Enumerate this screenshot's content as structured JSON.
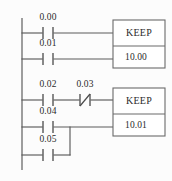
{
  "diagram": {
    "type": "ladder-logic",
    "width": 172,
    "height": 181,
    "background_color": "#fcfcfc",
    "line_color": "#5a5a5a",
    "text_color": "#2b2b2b"
  },
  "power_rail": {
    "name": "left-power-rail",
    "x": 22,
    "y_top": 18,
    "y_bottom": 170
  },
  "rungs": [
    {
      "index": 1,
      "y": 33,
      "contacts": [
        {
          "label": "0.00",
          "x": 48,
          "type": "normally-open"
        }
      ],
      "connects_to": "keep-block-1-set"
    },
    {
      "index": 2,
      "y": 59,
      "contacts": [
        {
          "label": "0.01",
          "x": 48,
          "type": "normally-open"
        }
      ],
      "connects_to": "keep-block-1-reset"
    },
    {
      "index": 3,
      "y": 100,
      "contacts": [
        {
          "label": "0.02",
          "x": 48,
          "type": "normally-open"
        },
        {
          "label": "0.03",
          "x": 84,
          "type": "normally-closed"
        }
      ],
      "connects_to": "keep-block-2-set"
    },
    {
      "index": 4,
      "y": 127,
      "contacts": [
        {
          "label": "0.04",
          "x": 48,
          "type": "normally-open"
        }
      ],
      "connects_to": "keep-block-2-reset"
    },
    {
      "index": 5,
      "y": 155,
      "contacts": [
        {
          "label": "0.05",
          "x": 48,
          "type": "normally-open"
        }
      ],
      "connects_to": "branch-junction"
    }
  ],
  "branch": {
    "name": "parallel-branch-connector",
    "x": 70,
    "y_top": 127,
    "y_bottom": 155,
    "description": "parallel OR branch joining contact 0.05 to rung of contact 0.04"
  },
  "blocks": [
    {
      "id": "keep-block-1",
      "instruction": "KEEP",
      "operand": "10.00",
      "x": 113,
      "y": 20,
      "width": 52,
      "height": 48,
      "divider_y": 46
    },
    {
      "id": "keep-block-2",
      "instruction": "KEEP",
      "operand": "10.01",
      "x": 113,
      "y": 88,
      "width": 52,
      "height": 48,
      "divider_y": 114
    }
  ],
  "labels": {
    "contact_1": "0.00",
    "contact_2": "0.01",
    "contact_3": "0.02",
    "contact_4": "0.03",
    "contact_5": "0.04",
    "contact_6": "0.05",
    "block_1_title": "KEEP",
    "block_1_operand": "10.00",
    "block_2_title": "KEEP",
    "block_2_operand": "10.01"
  }
}
